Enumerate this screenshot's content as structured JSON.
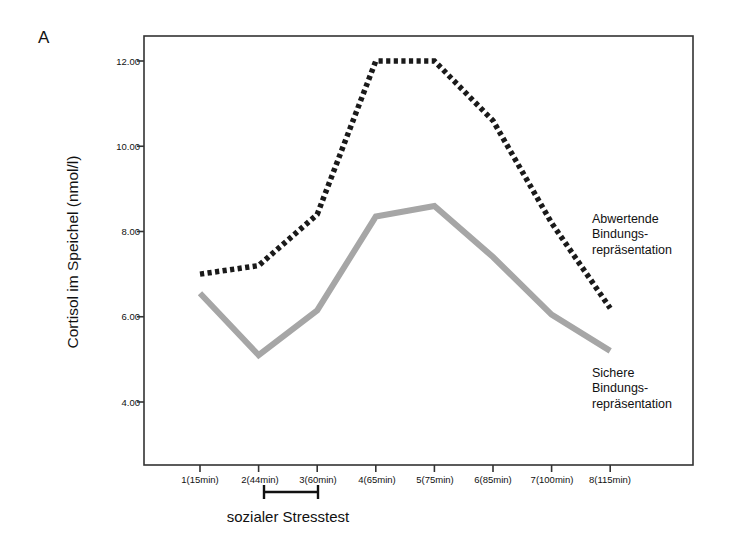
{
  "panel": {
    "letter": "A"
  },
  "axes": {
    "y_title": "Cortisol im Speichel (nmol/l)",
    "y_ticks": [
      "4.00",
      "6.00",
      "8.00",
      "10.00",
      "12.00"
    ],
    "x_ticks": [
      "1(15min)",
      "2(44min)",
      "3(60min)",
      "4(65min)",
      "5(75min)",
      "6(85min)",
      "7(100min)",
      "8(115min)"
    ]
  },
  "annotations": {
    "stress_test": "sozialer Stresstest",
    "series_dismissive": "Abwertende\nBindungs-\nrepräsentation",
    "series_dismissive_lines": [
      "Abwertende",
      "Bindungs-",
      "repräsentation"
    ],
    "series_secure_lines": [
      "Sichere",
      "Bindungs-",
      "repräsentation"
    ]
  },
  "colors": {
    "dismissive": "#1a1a1a",
    "secure": "#a6a6a6",
    "axis": "#333333",
    "background": "#ffffff"
  },
  "chart_data": {
    "type": "line",
    "title": "",
    "xlabel": "",
    "ylabel": "Cortisol im Speichel (nmol/l)",
    "categories": [
      "1(15min)",
      "2(44min)",
      "3(60min)",
      "4(65min)",
      "5(75min)",
      "6(85min)",
      "7(100min)",
      "8(115min)"
    ],
    "x_minutes": [
      15,
      44,
      60,
      65,
      75,
      85,
      100,
      115
    ],
    "ylim": [
      3.2,
      12.6
    ],
    "yticks": [
      4.0,
      6.0,
      8.0,
      10.0,
      12.0
    ],
    "grid": false,
    "legend_position": "inline-right",
    "series": [
      {
        "name": "Abwertende Bindungsrepräsentation",
        "style": "dotted",
        "color": "#1a1a1a",
        "values": [
          7.0,
          7.2,
          8.4,
          12.0,
          12.0,
          10.6,
          8.2,
          6.2
        ]
      },
      {
        "name": "Sichere Bindungsrepräsentation",
        "style": "solid",
        "color": "#a6a6a6",
        "values": [
          6.55,
          5.1,
          6.15,
          8.35,
          8.6,
          7.4,
          6.05,
          5.2
        ]
      }
    ],
    "annotations": [
      {
        "text": "sozialer Stresstest",
        "x_range": [
          "2(44min)",
          "3(60min)"
        ],
        "position": "below-axis"
      }
    ]
  }
}
